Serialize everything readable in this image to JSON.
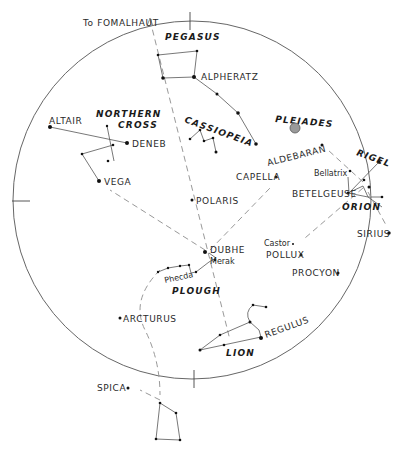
{
  "horizon": {
    "cx": 192,
    "cy": 200,
    "r": 179
  },
  "pointer_labels": {
    "fomalhaut": "To FOMALHAUT"
  },
  "constellations": {
    "pegasus": "PEGASUS",
    "northern_cross_1": "NORTHERN",
    "northern_cross_2": "CROSS",
    "cassiopeia": "CASSIOPEIA",
    "pleiades": "PLEIADES",
    "orion": "ORION",
    "plough": "PLOUGH",
    "lion": "LION"
  },
  "stars": {
    "alpheratz": "ALPHERATZ",
    "altair": "ALTAIR",
    "deneb": "DENEB",
    "vega": "VEGA",
    "polaris": "POLARIS",
    "capella": "CAPELLA",
    "aldebaran": "ALDEBARAN",
    "rigel": "RIGEL",
    "bellatrix": "Bellatrix",
    "betelgeuse": "BETELGEUSE",
    "sirius": "SIRIUS",
    "castor": "Castor",
    "pollux": "POLLUX",
    "procyon": "PROCYON",
    "dubhe": "DUBHE",
    "merak": "Merak",
    "phecda": "Phecda",
    "arcturus": "ARCTURUS",
    "regulus": "REGULUS",
    "spica": "SPICA"
  },
  "colors": {
    "ink": "#1a1a1a",
    "guide": "#999999",
    "pleiades": "#9a9a9a"
  }
}
